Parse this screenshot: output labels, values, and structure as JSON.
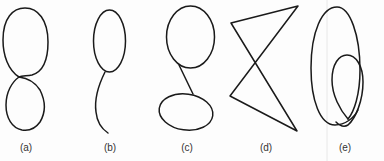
{
  "figure": {
    "panels": [
      {
        "id": "a",
        "label": "(a)",
        "label_x": 26,
        "shape": "figure-eight: two stacked loops crossing at a point"
      },
      {
        "id": "b",
        "label": "(b)",
        "label_x": 110,
        "shape": "ellipse loop with a curved tail hanging below"
      },
      {
        "id": "c",
        "label": "(c)",
        "label_x": 187,
        "shape": "upper circle connected by a straight segment to a lower horizontal ellipse"
      },
      {
        "id": "d",
        "label": "(d)",
        "label_x": 266,
        "shape": "self-intersecting polygon (bow-tie of straight segments)"
      },
      {
        "id": "e",
        "label": "(e)",
        "label_x": 345,
        "shape": "large oval with an inner loop crossing at the bottom"
      }
    ],
    "colors": {
      "stroke": "#1a1a1a",
      "background": "#fdfdfd",
      "label": "#333333"
    }
  }
}
